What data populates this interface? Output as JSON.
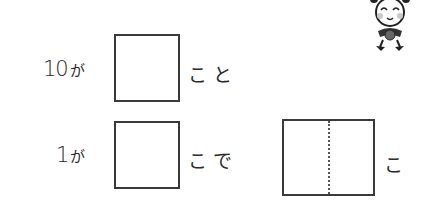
{
  "rows": [
    {
      "number": "10",
      "particle": "が",
      "suffix": "こと"
    },
    {
      "number": "1",
      "particle": "が",
      "suffix": "こで"
    }
  ],
  "result": {
    "suffix": "こ"
  },
  "mascot": {
    "icon": "smiling-ant-mascot"
  },
  "colors": {
    "line": "#3a3a3a",
    "text": "#2a2a2a",
    "cheek": "#c8c8c8"
  }
}
